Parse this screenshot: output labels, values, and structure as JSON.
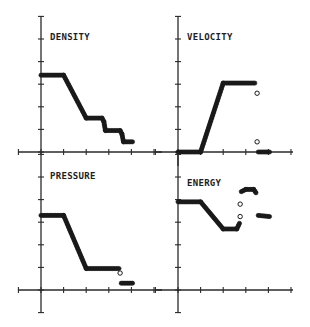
{
  "chart_data": {
    "type": "scatter",
    "title": "",
    "layout": "2x2 grid of panels",
    "x_tick_count": 5,
    "y_tick_count_upper": 6,
    "grid": false,
    "legend": "none",
    "panels": [
      {
        "id": "density",
        "title": "DENSITY",
        "position": "top-left",
        "xlim": [
          -0.8,
          5.6
        ],
        "ylim": [
          0,
          6
        ],
        "segments": [
          {
            "kind": "line",
            "points": [
              [
                0,
                3.4
              ],
              [
                1.0,
                3.4
              ],
              [
                2.0,
                1.5
              ],
              [
                2.7,
                1.5
              ],
              [
                2.78,
                1.35
              ],
              [
                2.85,
                0.95
              ],
              [
                3.5,
                0.95
              ],
              [
                3.58,
                0.8
              ],
              [
                3.65,
                0.45
              ],
              [
                4.05,
                0.45
              ]
            ]
          }
        ]
      },
      {
        "id": "velocity",
        "title": "VELOCITY",
        "position": "top-right",
        "xlim": [
          -0.8,
          5.6
        ],
        "ylim": [
          0,
          6
        ],
        "segments": [
          {
            "kind": "line",
            "points": [
              [
                0,
                0
              ],
              [
                1.0,
                0
              ],
              [
                2.0,
                3.05
              ],
              [
                3.4,
                3.05
              ]
            ]
          },
          {
            "kind": "isolated",
            "points": [
              [
                3.5,
                2.6
              ],
              [
                3.5,
                0.45
              ]
            ]
          },
          {
            "kind": "line",
            "points": [
              [
                3.55,
                0
              ],
              [
                4.05,
                0
              ]
            ]
          }
        ]
      },
      {
        "id": "pressure",
        "title": "PRESSURE",
        "position": "bottom-left",
        "xlim": [
          -0.8,
          5.6
        ],
        "ylim": [
          -1,
          6
        ],
        "segments": [
          {
            "kind": "line",
            "points": [
              [
                0,
                3.3
              ],
              [
                1.0,
                3.3
              ],
              [
                2.0,
                0.95
              ],
              [
                3.45,
                0.95
              ]
            ]
          },
          {
            "kind": "isolated",
            "points": [
              [
                3.5,
                0.75
              ]
            ]
          },
          {
            "kind": "line",
            "points": [
              [
                3.55,
                0.3
              ],
              [
                4.05,
                0.3
              ]
            ]
          }
        ]
      },
      {
        "id": "energy",
        "title": "ENERGY",
        "position": "bottom-right",
        "xlim": [
          -0.8,
          5.6
        ],
        "ylim": [
          -1,
          6
        ],
        "segments": [
          {
            "kind": "line",
            "points": [
              [
                0,
                3.9
              ],
              [
                1.0,
                3.9
              ],
              [
                2.0,
                2.7
              ],
              [
                2.6,
                2.7
              ],
              [
                2.72,
                2.95
              ]
            ]
          },
          {
            "kind": "isolated",
            "points": [
              [
                2.75,
                3.25
              ],
              [
                2.75,
                3.8
              ]
            ]
          },
          {
            "kind": "line",
            "points": [
              [
                2.8,
                4.35
              ],
              [
                3.0,
                4.45
              ],
              [
                3.35,
                4.45
              ],
              [
                3.45,
                4.3
              ]
            ]
          },
          {
            "kind": "line",
            "points": [
              [
                3.55,
                3.3
              ],
              [
                4.05,
                3.25
              ]
            ]
          }
        ]
      }
    ]
  }
}
